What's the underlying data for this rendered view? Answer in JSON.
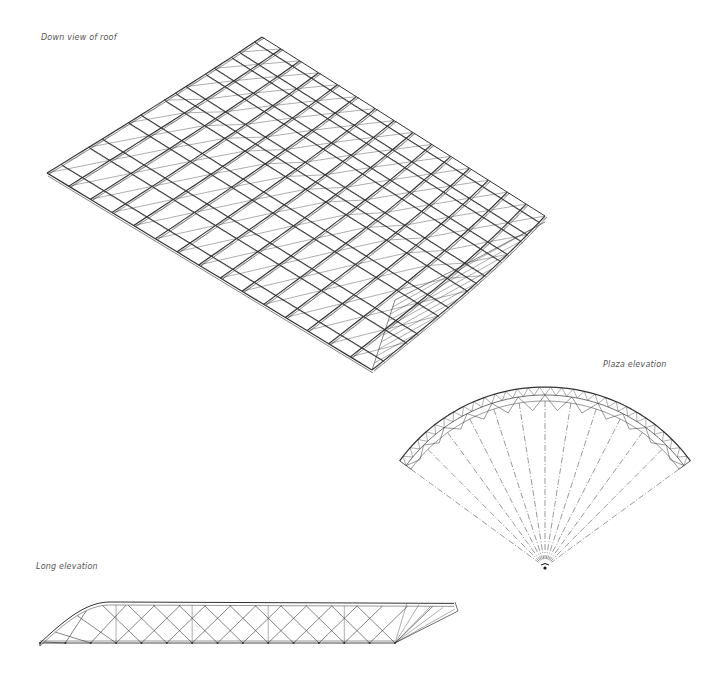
{
  "drawing": {
    "subject": "Steel lattice roof structure drawings",
    "line_color": "#333333",
    "background_color": "#ffffff",
    "views": [
      {
        "id": "down-view",
        "label": "Down view of roof",
        "arch_ribs": 16,
        "purlins": 14
      },
      {
        "id": "plaza-elevation",
        "label": "Plaza elevation",
        "radial_lines": 13
      },
      {
        "id": "long-elevation",
        "label": "Long elevation",
        "diamond_bays": 14
      }
    ]
  }
}
